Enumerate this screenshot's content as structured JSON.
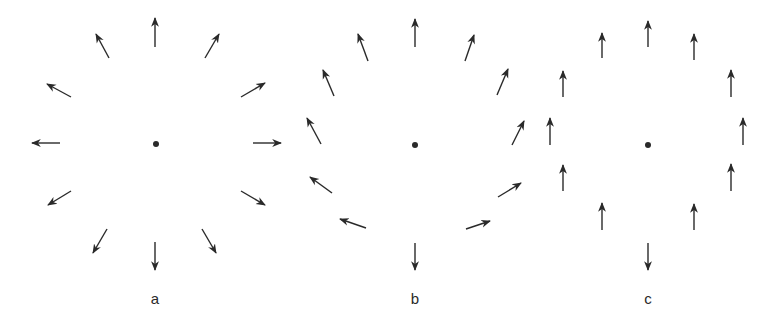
{
  "diagrams": [
    {
      "id": "a",
      "label": "a",
      "center": [
        156,
        144
      ],
      "arrows": [
        [
          155,
          47,
          155,
          18
        ],
        [
          205,
          58,
          219,
          34
        ],
        [
          241,
          97,
          265,
          83
        ],
        [
          253,
          143,
          281,
          143
        ],
        [
          241,
          191,
          265,
          205
        ],
        [
          202,
          229,
          216,
          253
        ],
        [
          155,
          242,
          155,
          270
        ],
        [
          107,
          229,
          93,
          253
        ],
        [
          71,
          191,
          48,
          205
        ],
        [
          60,
          143,
          32,
          143
        ],
        [
          71,
          97,
          47,
          84
        ],
        [
          109,
          58,
          96,
          34
        ]
      ],
      "label_pos": [
        155,
        290
      ]
    },
    {
      "id": "b",
      "label": "b",
      "center": [
        415,
        145
      ],
      "arrows": [
        [
          415,
          47,
          415,
          19
        ],
        [
          465,
          61,
          474,
          35
        ],
        [
          497,
          95,
          508,
          69
        ],
        [
          512,
          145,
          524,
          121
        ],
        [
          498,
          197,
          521,
          183
        ],
        [
          466,
          229,
          490,
          221
        ],
        [
          415,
          243,
          415,
          270
        ],
        [
          366,
          228,
          340,
          219
        ],
        [
          332,
          193,
          310,
          177
        ],
        [
          321,
          144,
          307,
          118
        ],
        [
          334,
          96,
          323,
          70
        ],
        [
          368,
          61,
          358,
          34
        ]
      ],
      "label_pos": [
        415,
        290
      ]
    },
    {
      "id": "c",
      "label": "c",
      "center": [
        648,
        145
      ],
      "arrows": [
        [
          648,
          47,
          648,
          21
        ],
        [
          694,
          60,
          694,
          34
        ],
        [
          731,
          97,
          731,
          70
        ],
        [
          743,
          145,
          743,
          118
        ],
        [
          731,
          191,
          731,
          164
        ],
        [
          694,
          230,
          694,
          204
        ],
        [
          648,
          243,
          648,
          270
        ],
        [
          602,
          230,
          602,
          203
        ],
        [
          563,
          191,
          563,
          165
        ],
        [
          550,
          145,
          550,
          118
        ],
        [
          563,
          97,
          563,
          71
        ],
        [
          602,
          58,
          602,
          33
        ]
      ],
      "label_pos": [
        648,
        290
      ]
    }
  ],
  "colors": {
    "stroke": "#2a2a2a",
    "background": "#ffffff"
  }
}
